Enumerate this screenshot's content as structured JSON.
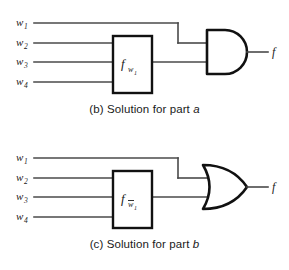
{
  "figures": [
    {
      "id": "figure-b",
      "caption_prefix": "(b) Solution for part ",
      "caption_letter": "a",
      "caption_full": "(b) Solution for part a",
      "gate": {
        "type": "AND",
        "name": "and-gate"
      },
      "box": {
        "function": "f",
        "subscript": "w",
        "subscript_index": "1",
        "subscript_negated": false,
        "label_full": "f_w1"
      },
      "inputs": [
        {
          "base": "w",
          "index": "1",
          "label": "w1"
        },
        {
          "base": "w",
          "index": "2",
          "label": "w2"
        },
        {
          "base": "w",
          "index": "3",
          "label": "w3"
        },
        {
          "base": "w",
          "index": "4",
          "label": "w4"
        }
      ],
      "output": {
        "label": "f"
      }
    },
    {
      "id": "figure-c",
      "caption_prefix": "(c) Solution for part ",
      "caption_letter": "b",
      "caption_full": "(c) Solution for part b",
      "gate": {
        "type": "OR",
        "name": "or-gate"
      },
      "box": {
        "function": "f",
        "subscript": "w",
        "subscript_index": "1",
        "subscript_negated": true,
        "label_full": "f_w1bar"
      },
      "inputs": [
        {
          "base": "w",
          "index": "1",
          "label": "w1"
        },
        {
          "base": "w",
          "index": "2",
          "label": "w2"
        },
        {
          "base": "w",
          "index": "3",
          "label": "w3"
        },
        {
          "base": "w",
          "index": "4",
          "label": "w4"
        }
      ],
      "output": {
        "label": "f"
      }
    }
  ],
  "colors": {
    "background": "#ffffff",
    "wire": "#4a4a4a",
    "outline": "#111111",
    "text": "#1a1a1a"
  }
}
